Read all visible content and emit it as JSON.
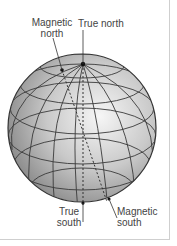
{
  "diagram": {
    "labels": {
      "magnetic_north": "Magnetic\nnorth",
      "magnetic_north_l1": "Magnetic",
      "magnetic_north_l2": "north",
      "true_north": "True north",
      "true_south_l1": "True",
      "true_south_l2": "south",
      "magnetic_south_l1": "Magnetic",
      "magnetic_south_l2": "south"
    },
    "colors": {
      "globe_light": "#f4f4f4",
      "globe_dark": "#8a8a8a",
      "lines": "#333333",
      "text": "#444444"
    }
  }
}
